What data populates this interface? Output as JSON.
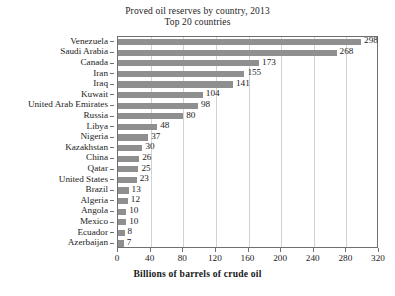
{
  "chart_data": {
    "type": "bar",
    "orientation": "horizontal",
    "title": "Proved oil reserves by country, 2013",
    "subtitle": "Top 20 countries",
    "xlabel": "Billions of barrels of crude oil",
    "ylabel": "",
    "xlim": [
      0,
      320
    ],
    "xticks": [
      0,
      40,
      80,
      120,
      160,
      200,
      240,
      280,
      320
    ],
    "grid": "vertical",
    "legend": "none",
    "bar_color": "#8f8f8f",
    "categories": [
      "Venezuela",
      "Saudi Arabia",
      "Canada",
      "Iran",
      "Iraq",
      "Kuwait",
      "United Arab Emirates",
      "Russia",
      "Libya",
      "Nigeria",
      "Kazakhstan",
      "China",
      "Qatar",
      "United States",
      "Brazil",
      "Algeria",
      "Angola",
      "Mexico",
      "Ecuador",
      "Azerbaijan"
    ],
    "values": [
      298,
      268,
      173,
      155,
      141,
      104,
      98,
      80,
      48,
      37,
      30,
      26,
      25,
      23,
      13,
      12,
      10,
      10,
      8,
      7
    ],
    "value_labels": [
      "298",
      "268",
      "173",
      "155",
      "141",
      "104",
      "98",
      "80",
      "48",
      "37",
      "30",
      "26",
      "25",
      "23",
      "13",
      "12",
      "10",
      "10",
      "8",
      "7"
    ]
  }
}
